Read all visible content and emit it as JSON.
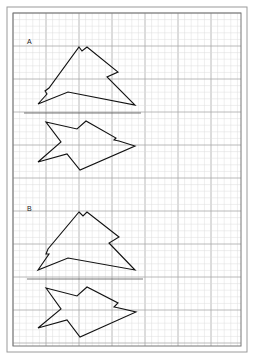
{
  "page": {
    "background": "#ffffff",
    "outer_border": {
      "x": 7,
      "y": 7,
      "w": 240,
      "h": 345,
      "color": "#9a9a9a"
    },
    "grid_area": {
      "x": 13,
      "y": 13,
      "w": 228,
      "h": 333,
      "border_color": "#777777"
    },
    "grid": {
      "minor_step": 6.6,
      "major_every": 5,
      "minor_color": "#dcdcdc",
      "major_color": "#a8a8a8"
    }
  },
  "figures": [
    {
      "label": "A",
      "label_pos": [
        27,
        44
      ],
      "stroke": "#111111",
      "top_shape": [
        [
          79,
          47
        ],
        [
          82,
          51
        ],
        [
          87,
          47
        ],
        [
          118,
          72
        ],
        [
          107,
          77
        ],
        [
          135,
          105
        ],
        [
          68,
          92
        ],
        [
          38,
          104
        ],
        [
          47,
          94
        ],
        [
          45,
          91
        ],
        [
          49,
          88
        ]
      ],
      "separator": {
        "x1": 24,
        "y1": 113,
        "x2": 141,
        "y2": 113
      },
      "bottom_shape": [
        [
          46,
          122
        ],
        [
          77,
          129
        ],
        [
          86,
          121
        ],
        [
          116,
          138
        ],
        [
          114,
          140
        ],
        [
          119,
          141
        ],
        [
          135,
          146
        ],
        [
          80,
          170
        ],
        [
          67,
          154
        ],
        [
          38,
          162
        ],
        [
          61,
          142
        ]
      ]
    },
    {
      "label": "B",
      "label_pos": [
        27,
        211
      ],
      "stroke": "#111111",
      "top_shape": [
        [
          79,
          212
        ],
        [
          83,
          216
        ],
        [
          87,
          212
        ],
        [
          119,
          237
        ],
        [
          109,
          243
        ],
        [
          135,
          270
        ],
        [
          68,
          258
        ],
        [
          38,
          270
        ],
        [
          49,
          254
        ],
        [
          46,
          254
        ],
        [
          48,
          249
        ]
      ],
      "separator": {
        "x1": 27,
        "y1": 279,
        "x2": 143,
        "y2": 279
      },
      "bottom_shape": [
        [
          46,
          288
        ],
        [
          77,
          296
        ],
        [
          87,
          287
        ],
        [
          118,
          303
        ],
        [
          114,
          307
        ],
        [
          119,
          308
        ],
        [
          136,
          312
        ],
        [
          80,
          337
        ],
        [
          67,
          320
        ],
        [
          38,
          328
        ],
        [
          61,
          309
        ]
      ]
    }
  ]
}
